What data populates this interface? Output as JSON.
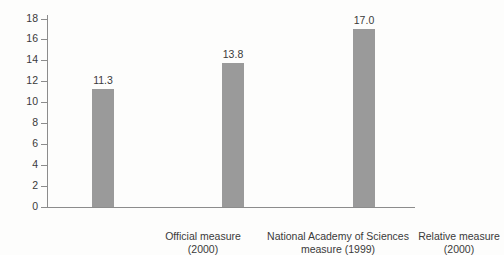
{
  "chart_data": {
    "type": "bar",
    "title": "",
    "xlabel": "",
    "ylabel": "Percent poor",
    "ylim": [
      0,
      18
    ],
    "ytick_step": 2,
    "grid": false,
    "legend": false,
    "bar_color": "#9a9a9a",
    "axis_color": "#8c8c8c",
    "background_color": "#fdfdfc",
    "yticks": [
      0,
      2,
      4,
      6,
      8,
      10,
      12,
      14,
      16,
      18
    ],
    "ytick_labels": [
      "0",
      "2",
      "4",
      "6",
      "8",
      "10",
      "12",
      "14",
      "16",
      "18"
    ],
    "categories": [
      "Official measure (2000)",
      "National Academy of Sciences measure (1999)",
      "Relative measure (2000)"
    ],
    "category_lines": [
      {
        "line1": "Official measure",
        "line2": "(2000)"
      },
      {
        "line1": "National Academy of Sciences",
        "line2": "measure (1999)"
      },
      {
        "line1": "Relative measure",
        "line2": "(2000)"
      }
    ],
    "values": [
      11.3,
      13.8,
      17.0
    ],
    "value_labels": [
      "11.3",
      "13.8",
      "17.0"
    ]
  }
}
